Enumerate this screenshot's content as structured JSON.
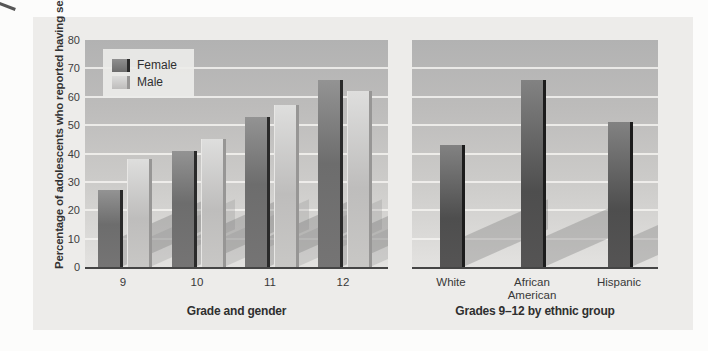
{
  "page": {
    "kind": "textbook-figure",
    "background": "#fcfcfb"
  },
  "colors": {
    "figure_background": "#edecea",
    "plot_gradient_top": "#b2b2b2",
    "plot_gradient_bottom": "#e3e2e0",
    "gridline": "#f3f2f0",
    "female_bar": "#6d6d6d",
    "female_bar_edge": "#2a2a2a",
    "male_bar": "#c2c1c0",
    "male_bar_edge": "#979695",
    "ethnic_bar": "#4e4e4e",
    "ethnic_bar_edge": "#1c1c1c",
    "axis_line": "#454545",
    "text": "#333333",
    "bar_floor_shadow": "#8a8a8a"
  },
  "legend": {
    "items": [
      {
        "label": "Female",
        "swatch": "female"
      },
      {
        "label": "Male",
        "swatch": "male"
      }
    ],
    "position": "top-left"
  },
  "chart_data": [
    {
      "type": "bar",
      "panel": "left",
      "title": "",
      "xlabel": "Grade and gender",
      "ylabel": "Percentage of adolescents who reported having sex",
      "categories": [
        "9",
        "10",
        "11",
        "12"
      ],
      "series": [
        {
          "name": "Female",
          "values": [
            27,
            41,
            53,
            66
          ]
        },
        {
          "name": "Male",
          "values": [
            38,
            45,
            57,
            62
          ]
        }
      ],
      "ylim": [
        0,
        80
      ],
      "yticks": [
        0,
        10,
        20,
        30,
        40,
        50,
        60,
        70,
        80
      ],
      "grid": true,
      "legend_position": "top-left"
    },
    {
      "type": "bar",
      "panel": "right",
      "title": "",
      "xlabel": "Grades 9–12 by ethnic group",
      "ylabel": "",
      "categories": [
        "White",
        "African American",
        "Hispanic"
      ],
      "series": [
        {
          "name": "Grades 9-12",
          "values": [
            43,
            66,
            51
          ]
        }
      ],
      "ylim": [
        0,
        80
      ],
      "yticks": [
        0,
        10,
        20,
        30,
        40,
        50,
        60,
        70,
        80
      ],
      "grid": true,
      "legend_position": "none"
    }
  ]
}
